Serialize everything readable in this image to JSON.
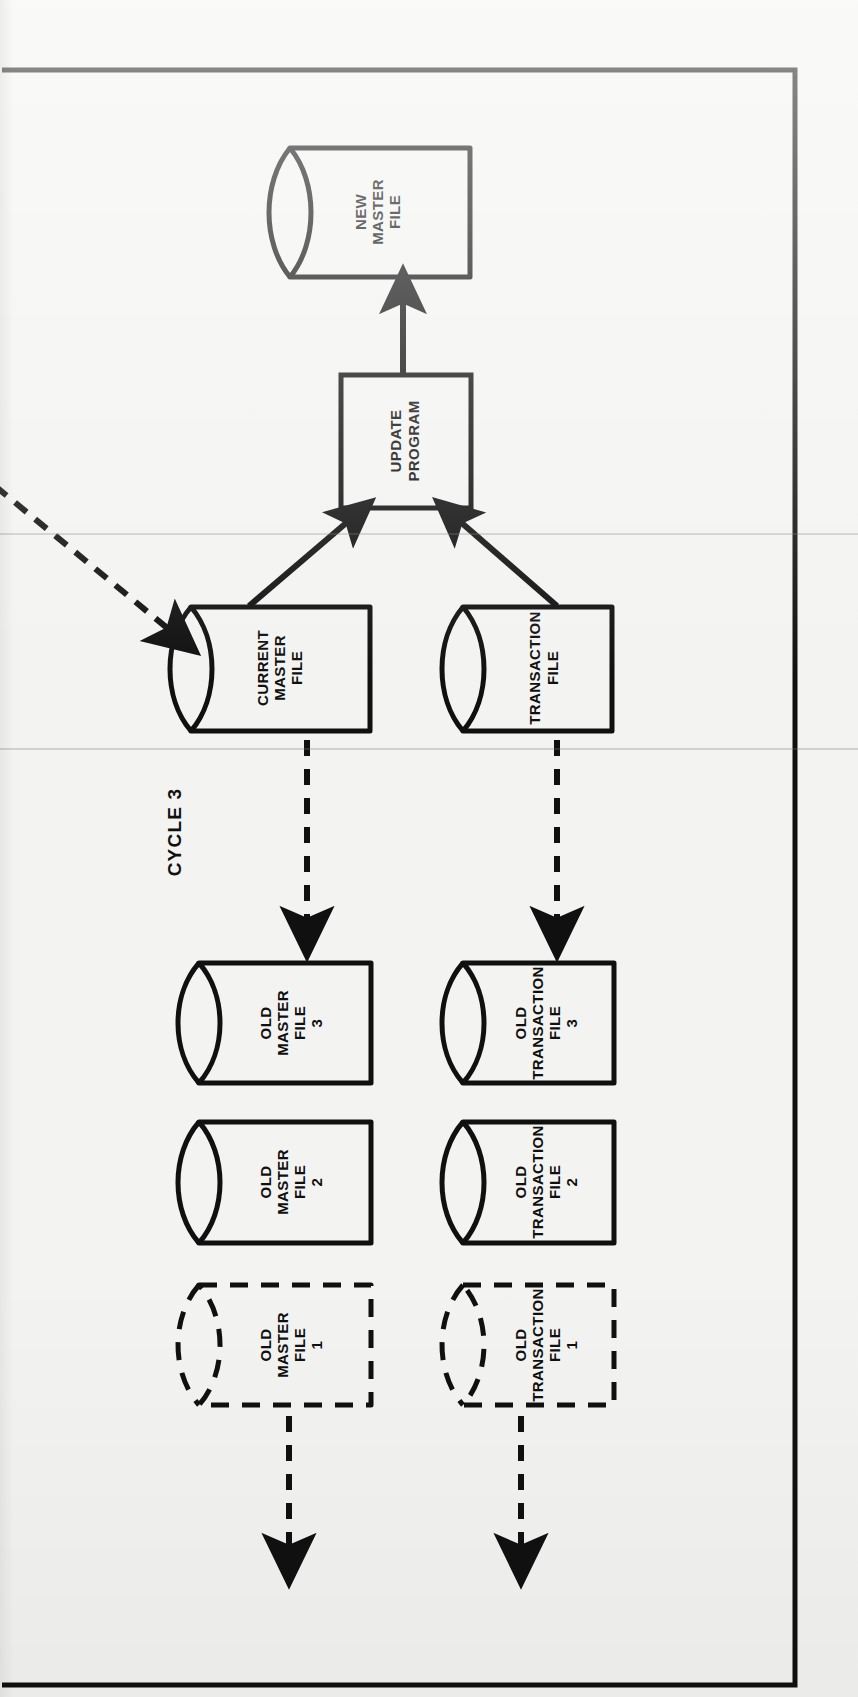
{
  "page": {
    "title": "CYCLE 3",
    "orientation": "rotated-90",
    "background_color": "#f3f3f1",
    "ink_color": "#101010",
    "border": {
      "visible": true,
      "color": "#101010"
    }
  },
  "diagram": {
    "type": "system-flowchart",
    "cycle_label": "CYCLE 3",
    "nodes": [
      {
        "id": "new-master-file",
        "shape": "cylinder",
        "outline": "solid",
        "lines": [
          "NEW",
          "MASTER",
          "FILE"
        ]
      },
      {
        "id": "update-program",
        "shape": "rectangle",
        "outline": "solid",
        "lines": [
          "UPDATE",
          "PROGRAM"
        ]
      },
      {
        "id": "current-master-file",
        "shape": "cylinder",
        "outline": "solid",
        "lines": [
          "CURRENT",
          "MASTER",
          "FILE"
        ]
      },
      {
        "id": "transaction-file",
        "shape": "cylinder",
        "outline": "solid",
        "lines": [
          "TRANSACTION",
          "FILE"
        ]
      },
      {
        "id": "old-master-file-3",
        "shape": "cylinder",
        "outline": "solid",
        "lines": [
          "OLD",
          "MASTER",
          "FILE",
          "3"
        ]
      },
      {
        "id": "old-master-file-2",
        "shape": "cylinder",
        "outline": "solid",
        "lines": [
          "OLD",
          "MASTER",
          "FILE",
          "2"
        ]
      },
      {
        "id": "old-master-file-1",
        "shape": "cylinder",
        "outline": "dashed",
        "lines": [
          "OLD",
          "MASTER",
          "FILE",
          "1"
        ]
      },
      {
        "id": "old-transaction-file-3",
        "shape": "cylinder",
        "outline": "solid",
        "lines": [
          "OLD",
          "TRANSACTION",
          "FILE",
          "3"
        ]
      },
      {
        "id": "old-transaction-file-2",
        "shape": "cylinder",
        "outline": "solid",
        "lines": [
          "OLD",
          "TRANSACTION",
          "FILE",
          "2"
        ]
      },
      {
        "id": "old-transaction-file-1",
        "shape": "cylinder",
        "outline": "dashed",
        "lines": [
          "OLD",
          "TRANSACTION",
          "FILE",
          "1"
        ]
      }
    ],
    "edges": [
      {
        "id": "current-master-to-update",
        "from": "current-master-file",
        "to": "update-program",
        "style": "solid"
      },
      {
        "id": "transaction-to-update",
        "from": "transaction-file",
        "to": "update-program",
        "style": "solid"
      },
      {
        "id": "update-to-new-master",
        "from": "update-program",
        "to": "new-master-file",
        "style": "solid"
      },
      {
        "id": "incoming-to-current-master",
        "from": "offpage",
        "to": "current-master-file",
        "style": "dashed"
      },
      {
        "id": "current-master-to-old-master-3",
        "from": "current-master-file",
        "to": "old-master-file-3",
        "style": "dashed"
      },
      {
        "id": "transaction-to-old-transaction-3",
        "from": "transaction-file",
        "to": "old-transaction-file-3",
        "style": "dashed"
      },
      {
        "id": "old-master-1-to-offpage",
        "from": "old-master-file-1",
        "to": "offpage",
        "style": "dashed"
      },
      {
        "id": "old-transaction-1-to-offpage",
        "from": "old-transaction-file-1",
        "to": "offpage",
        "style": "dashed"
      }
    ]
  }
}
